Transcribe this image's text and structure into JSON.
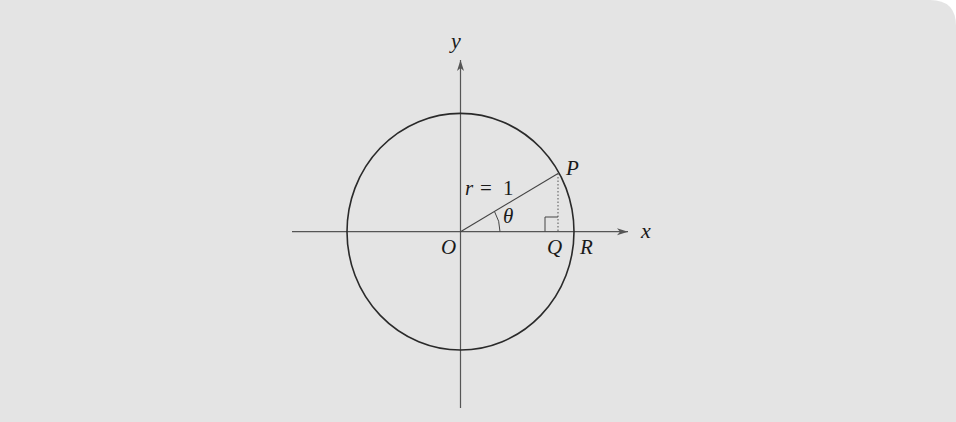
{
  "colors": {
    "background": "#e4e4e4",
    "stroke": "#2a2a2a",
    "page": "#ffffff"
  },
  "diagram": {
    "axes": {
      "x_label": "x",
      "y_label": "y"
    },
    "points": {
      "origin": "O",
      "point_on_circle": "P",
      "foot_of_perpendicular": "Q",
      "x_intercept": "R"
    },
    "radius_label": {
      "var": "r",
      "eq": "=",
      "value": "1"
    },
    "angle_label": "θ",
    "right_angle_marker": true
  }
}
